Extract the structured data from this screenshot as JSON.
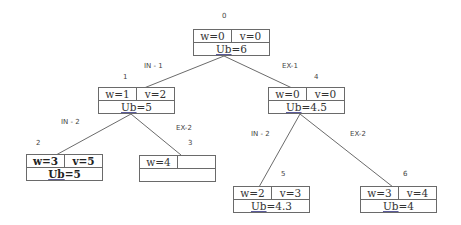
{
  "diagram": {
    "type": "branch-and-bound-tree",
    "nodes": [
      {
        "id": "0",
        "w": "w=0",
        "v": "v=0",
        "ub_prefix": "Ub",
        "ub_value": "=6",
        "bold": false
      },
      {
        "id": "1",
        "w": "w=1",
        "v": "v=2",
        "ub_prefix": "Ub",
        "ub_value": "=5",
        "bold": false
      },
      {
        "id": "2",
        "w": "w=3",
        "v": "v=5",
        "ub_prefix": "Ub",
        "ub_value": "=5",
        "bold": true
      },
      {
        "id": "3",
        "w": "w=4",
        "v": "",
        "ub_prefix": "",
        "ub_value": "",
        "bold": false
      },
      {
        "id": "4",
        "w": "w=0",
        "v": "v=0",
        "ub_prefix": "Ub",
        "ub_value": "=4.5",
        "bold": false
      },
      {
        "id": "5",
        "w": "w=2",
        "v": "v=3",
        "ub_prefix": "Ub",
        "ub_value": "=4.3",
        "bold": false
      },
      {
        "id": "6",
        "w": "w=3",
        "v": "v=4",
        "ub_prefix": "Ub",
        "ub_value": "=4",
        "bold": false
      }
    ],
    "edges": [
      {
        "from": "0",
        "to": "1",
        "label": "IN - 1"
      },
      {
        "from": "0",
        "to": "4",
        "label": "EX-1"
      },
      {
        "from": "1",
        "to": "2",
        "label": "IN - 2"
      },
      {
        "from": "1",
        "to": "3",
        "label": "EX-2"
      },
      {
        "from": "4",
        "to": "5",
        "label": "IN - 2"
      },
      {
        "from": "4",
        "to": "6",
        "label": "EX-2"
      }
    ]
  }
}
